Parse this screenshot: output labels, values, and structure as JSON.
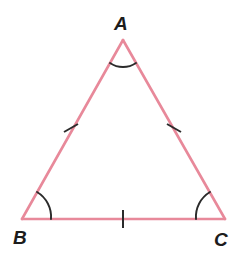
{
  "figure": {
    "kind": "geometry-diagram",
    "canvas": {
      "width": 248,
      "height": 253,
      "background": "#ffffff"
    },
    "stroke": {
      "side_color": "#e8899a",
      "side_width": 2.6,
      "mark_color": "#2b2b2b",
      "mark_width": 2.0,
      "arc_width": 1.9
    },
    "vertices": [
      {
        "id": "A",
        "label": "A",
        "x": 123,
        "y": 40,
        "label_x": 114,
        "label_y": 14
      },
      {
        "id": "B",
        "label": "B",
        "x": 22,
        "y": 219,
        "label_x": 13,
        "label_y": 228
      },
      {
        "id": "C",
        "label": "C",
        "x": 225,
        "y": 219,
        "label_x": 214,
        "label_y": 230
      }
    ],
    "sides": [
      {
        "id": "AB",
        "from": "A",
        "to": "B",
        "path": "M 123 40 L 22 219",
        "ticks": 1
      },
      {
        "id": "AC",
        "from": "A",
        "to": "C",
        "path": "M 123 40 L 225 219",
        "ticks": 1
      },
      {
        "id": "BC",
        "from": "B",
        "to": "C",
        "path": "M 22 219 L 225 219",
        "ticks": 1
      }
    ],
    "tick_marks": [
      {
        "id": "tick-AB",
        "side": "AB",
        "path": "M 64 132 L 78 124"
      },
      {
        "id": "tick-AC",
        "side": "AC",
        "path": "M 167 124 L 181 132"
      },
      {
        "id": "tick-BC",
        "side": "BC",
        "path": "M 123 210 L 123 228"
      }
    ],
    "angle_arcs": [
      {
        "id": "arc-A",
        "vertex": "A",
        "path": "M 110 63 A 23 23 0 0 0 136 63"
      },
      {
        "id": "arc-B",
        "vertex": "B",
        "path": "M 37 192 A 29 29 0 0 1 51 219"
      },
      {
        "id": "arc-C",
        "vertex": "C",
        "path": "M 196 219 A 29 29 0 0 1 210 192"
      }
    ]
  }
}
